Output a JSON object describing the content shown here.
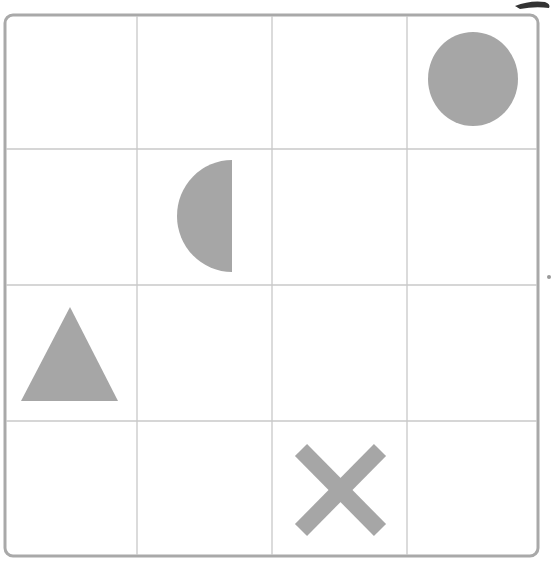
{
  "board": {
    "rows": 4,
    "cols": 4,
    "frame": {
      "x": 4,
      "y": 14,
      "w": 534,
      "h": 542,
      "radius": 8
    },
    "col_lines": [
      137,
      272,
      407
    ],
    "row_lines": [
      149,
      285,
      421
    ],
    "colors": {
      "frame": "#a9a9a9",
      "grid": "#c8c8c8",
      "shape": "#a6a6a6",
      "background": "#ffffff"
    }
  },
  "shapes": [
    {
      "type": "circle",
      "row": 1,
      "col": 4
    },
    {
      "type": "half-circle-left",
      "row": 2,
      "col": 2
    },
    {
      "type": "triangle",
      "row": 3,
      "col": 1
    },
    {
      "type": "x-cross",
      "row": 4,
      "col": 3
    }
  ]
}
